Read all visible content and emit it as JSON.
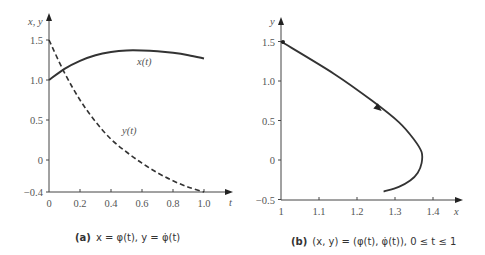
{
  "chart_data": [
    {
      "type": "line",
      "title": "",
      "caption_tag": "(a)",
      "caption": "x = φ(t),  y = φ̇(t)",
      "xlabel": "t",
      "ylabel": "x, y",
      "xlim": [
        0,
        1.0
      ],
      "ylim": [
        -0.4,
        1.5
      ],
      "xticks": [
        "0",
        "0.2",
        "0.4",
        "0.6",
        "0.8",
        "1.0"
      ],
      "yticks": [
        "−0.4",
        "0",
        "0.5",
        "1.0",
        "1.5"
      ],
      "grid": false,
      "series": [
        {
          "name": "x(t)",
          "style": "solid",
          "x": [
            0,
            0.1,
            0.2,
            0.3,
            0.4,
            0.5,
            0.6,
            0.7,
            0.8,
            0.9,
            1.0
          ],
          "values": [
            1.0,
            1.14,
            1.24,
            1.31,
            1.35,
            1.37,
            1.37,
            1.36,
            1.34,
            1.31,
            1.27
          ]
        },
        {
          "name": "y(t)",
          "style": "dashed",
          "x": [
            0,
            0.1,
            0.2,
            0.3,
            0.4,
            0.5,
            0.6,
            0.7,
            0.8,
            0.9,
            1.0
          ],
          "values": [
            1.5,
            1.09,
            0.75,
            0.48,
            0.26,
            0.1,
            -0.04,
            -0.16,
            -0.26,
            -0.34,
            -0.4
          ]
        }
      ]
    },
    {
      "type": "line",
      "title": "",
      "caption_tag": "(b)",
      "caption": "(x, y) = (φ(t), φ̇(t)),  0 ≤ t ≤ 1",
      "xlabel": "x",
      "ylabel": "y",
      "xlim": [
        1,
        1.45
      ],
      "ylim": [
        -0.5,
        1.5
      ],
      "xticks": [
        "1",
        "1.1",
        "1.2",
        "1.3",
        "1.4"
      ],
      "yticks": [
        "−0.5",
        "0",
        "0.5",
        "1.0",
        "1.5"
      ],
      "grid": false,
      "series": [
        {
          "name": "trajectory",
          "style": "solid",
          "x": [
            1.0,
            1.14,
            1.24,
            1.31,
            1.35,
            1.37,
            1.37,
            1.36,
            1.34,
            1.31,
            1.27
          ],
          "values": [
            1.5,
            1.09,
            0.75,
            0.48,
            0.26,
            0.1,
            -0.04,
            -0.16,
            -0.26,
            -0.34,
            -0.4
          ]
        }
      ]
    }
  ],
  "labels": {
    "a_curve_x": "x(t)",
    "a_curve_y": "y(t)"
  }
}
